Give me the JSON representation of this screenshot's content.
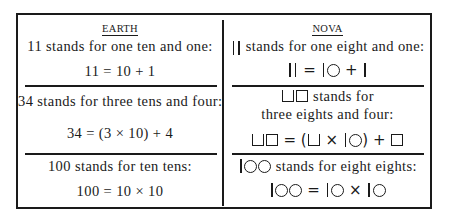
{
  "table": {
    "columns": [
      {
        "header": "EARTH"
      },
      {
        "header": "NOVA"
      }
    ],
    "earth_rows": [
      {
        "description": "11 stands for one ten and one:",
        "equation": "11 = 10 + 1"
      },
      {
        "description": "34 stands for three tens and four:",
        "equation": "34 = (3 × 10) + 4"
      },
      {
        "description": "100 stands for ten tens:",
        "equation": "100 = 10 × 10"
      }
    ],
    "nova_rows": [
      {
        "numeral_symbols": "| |",
        "description": "stands for one eight and one:",
        "equation_symbols": "| | = |○ + |",
        "equals": "=",
        "plus": "+"
      },
      {
        "numeral_symbols": "⊔□",
        "description_line1": "stands for",
        "description_line2": "three eights and four:",
        "equation_symbols": "⊔□ = (⊔ × |○) + □",
        "equals": "=",
        "times": "×",
        "plus": "+",
        "open_paren": "(",
        "close_paren": ")"
      },
      {
        "numeral_symbols": "|○○",
        "description": "stands for eight eights:",
        "equation_symbols": "|○○ = |○ × |○",
        "equals": "=",
        "times": "×"
      }
    ]
  }
}
